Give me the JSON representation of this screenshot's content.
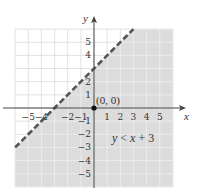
{
  "chart_data": {
    "type": "line",
    "title": "",
    "xlabel": "x",
    "ylabel": "y",
    "xlim": [
      -6,
      6
    ],
    "ylim": [
      -6,
      6
    ],
    "grid": true,
    "x_tick_labels": [
      "−5",
      "−4",
      "−2",
      "−1",
      "1",
      "2",
      "3",
      "4",
      "5"
    ],
    "x_tick_values": [
      -5,
      -4,
      -2,
      -1,
      1,
      2,
      3,
      4,
      5
    ],
    "y_tick_labels": [
      "5",
      "4",
      "2",
      "1",
      "−1",
      "−2",
      "−3",
      "−4",
      "−5"
    ],
    "y_tick_values": [
      5,
      4,
      2,
      1,
      -1,
      -2,
      -3,
      -4,
      -5
    ],
    "series": [
      {
        "name": "y = x + 3 (boundary)",
        "style": "dashed",
        "x": [
          -6,
          3
        ],
        "y": [
          -3,
          6
        ]
      }
    ],
    "shaded_region": {
      "inequality": "y < x + 3",
      "side": "below-right",
      "color": "#dcdcdc"
    },
    "points": [
      {
        "x": 0,
        "y": 0,
        "label": "(0, 0)"
      }
    ],
    "annotations": [
      {
        "text": "y < x + 3",
        "x": 3,
        "y": -2.3
      }
    ]
  },
  "labels": {
    "x_axis": "x",
    "y_axis": "y",
    "origin": "(0, 0)",
    "inequality": "y < x + 3"
  },
  "colors": {
    "shade": "#dcdcdc",
    "grid_on_white": "#dadada",
    "grid_on_shade": "#efefef",
    "axis": "#444444",
    "boundary": "#555555"
  }
}
